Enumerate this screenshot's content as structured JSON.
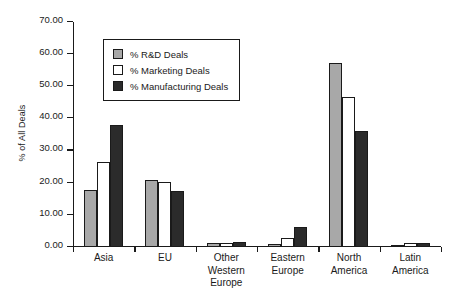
{
  "chart_data": {
    "type": "bar",
    "title": "",
    "subtitle": "",
    "xlabel": "",
    "ylabel": "% of All Deals",
    "ylim": [
      0,
      70
    ],
    "ytick_values": [
      0,
      10,
      20,
      30,
      40,
      50,
      60,
      70
    ],
    "ytick_labels": [
      "0.00",
      "10.00",
      "20.00",
      "30.00",
      "40.00",
      "50.00",
      "60.00",
      "70.00"
    ],
    "grid": false,
    "legend_position": "upper-left-inside",
    "categories": [
      "Asia",
      "EU",
      "Other Western Europe",
      "Eastern Europe",
      "North America",
      "Latin America"
    ],
    "category_labels": [
      "Asia",
      "EU",
      "Other Western\nEurope",
      "Eastern\nEurope",
      "North\nAmerica",
      "Latin\nAmerica"
    ],
    "series": [
      {
        "name": "% R&D Deals",
        "color": "#a8a8a8",
        "values": [
          17.8,
          20.7,
          1.3,
          0.9,
          57.3,
          0.7
        ]
      },
      {
        "name": "% Marketing Deals",
        "color": "#ffffff",
        "values": [
          26.3,
          20.2,
          1.4,
          2.9,
          46.7,
          1.4
        ]
      },
      {
        "name": "% Manufacturing Deals",
        "color": "#2b2b2b",
        "values": [
          38.0,
          17.5,
          1.5,
          6.2,
          36.2,
          1.1
        ]
      }
    ]
  },
  "axis": {
    "outline_color": "#1a1a1a"
  }
}
